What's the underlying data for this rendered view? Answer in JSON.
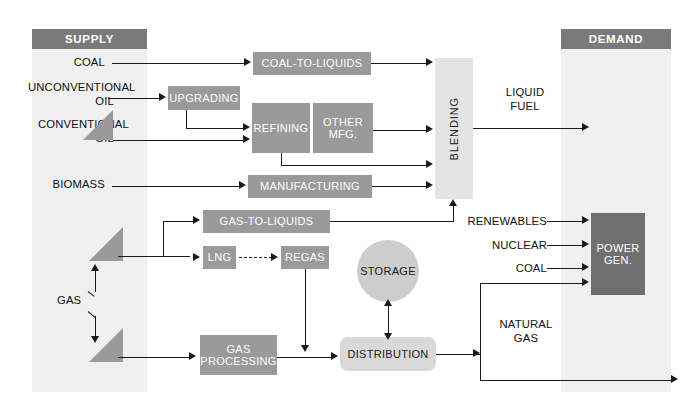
{
  "diagram": {
    "colors": {
      "panel_fill": "#f0f0f0",
      "panel_header": "#7a7a7a",
      "box_mid": "#9a9a9a",
      "box_dark": "#6f6f6f",
      "box_light": "#d9d9d9",
      "box_lightest": "#e4e4e4",
      "storage_fill": "#cdcdcd",
      "line": "#1a1a1a",
      "background": "#ffffff"
    }
  },
  "supply": {
    "header": "SUPPLY",
    "sources": [
      {
        "id": "coal",
        "label": "COAL"
      },
      {
        "id": "unconventional-oil",
        "label": "UNCONVENTIONAL\nOIL"
      },
      {
        "id": "conventional-oil",
        "label": "CONVENTIONAL\nOIL"
      },
      {
        "id": "biomass",
        "label": "BIOMASS"
      },
      {
        "id": "gas",
        "label": "GAS"
      }
    ]
  },
  "demand": {
    "header": "DEMAND",
    "outputs": [
      {
        "id": "liquid-fuel",
        "label": "LIQUID\nFUEL"
      },
      {
        "id": "natural-gas",
        "label": "NATURAL\nGAS"
      }
    ],
    "inputs": [
      {
        "id": "renewables",
        "label": "RENEWABLES"
      },
      {
        "id": "nuclear",
        "label": "NUCLEAR"
      },
      {
        "id": "coal-power",
        "label": "COAL"
      }
    ],
    "power_gen": "POWER\nGEN."
  },
  "processes": [
    {
      "id": "coal-to-liquids",
      "label": "COAL-TO-LIQUIDS",
      "style": "mid"
    },
    {
      "id": "upgrading",
      "label": "UPGRADING",
      "style": "mid"
    },
    {
      "id": "refining",
      "label": "REFINING",
      "style": "mid"
    },
    {
      "id": "other-mfg",
      "label": "OTHER\nMFG.",
      "style": "mid"
    },
    {
      "id": "manufacturing",
      "label": "MANUFACTURING",
      "style": "mid"
    },
    {
      "id": "gas-to-liquids",
      "label": "GAS-TO-LIQUIDS",
      "style": "mid"
    },
    {
      "id": "lng",
      "label": "LNG",
      "style": "mid"
    },
    {
      "id": "regas",
      "label": "REGAS",
      "style": "mid"
    },
    {
      "id": "gas-processing",
      "label": "GAS\nPROCESSING",
      "style": "mid"
    },
    {
      "id": "blending",
      "label": "BLENDING",
      "style": "lightest"
    },
    {
      "id": "storage",
      "label": "STORAGE",
      "style": "circle"
    },
    {
      "id": "distribution",
      "label": "DISTRIBUTION",
      "style": "light"
    }
  ],
  "labels": {
    "coal": "COAL",
    "unconventional_oil": "UNCONVENTIONAL\nOIL",
    "conventional_oil": "CONVENTIONAL\nOIL",
    "biomass": "BIOMASS",
    "gas": "GAS",
    "coal_to_liquids": "COAL-TO-LIQUIDS",
    "upgrading": "UPGRADING",
    "refining": "REFINING",
    "other_mfg": "OTHER\nMFG.",
    "manufacturing": "MANUFACTURING",
    "gas_to_liquids": "GAS-TO-LIQUIDS",
    "lng": "LNG",
    "regas": "REGAS",
    "gas_processing": "GAS\nPROCESSING",
    "blending": "BLENDING",
    "storage": "STORAGE",
    "distribution": "DISTRIBUTION",
    "liquid_fuel": "LIQUID\nFUEL",
    "natural_gas": "NATURAL\nGAS",
    "renewables": "RENEWABLES",
    "nuclear": "NUCLEAR",
    "coal_power": "COAL",
    "power_gen": "POWER\nGEN.",
    "supply_header": "SUPPLY",
    "demand_header": "DEMAND"
  }
}
